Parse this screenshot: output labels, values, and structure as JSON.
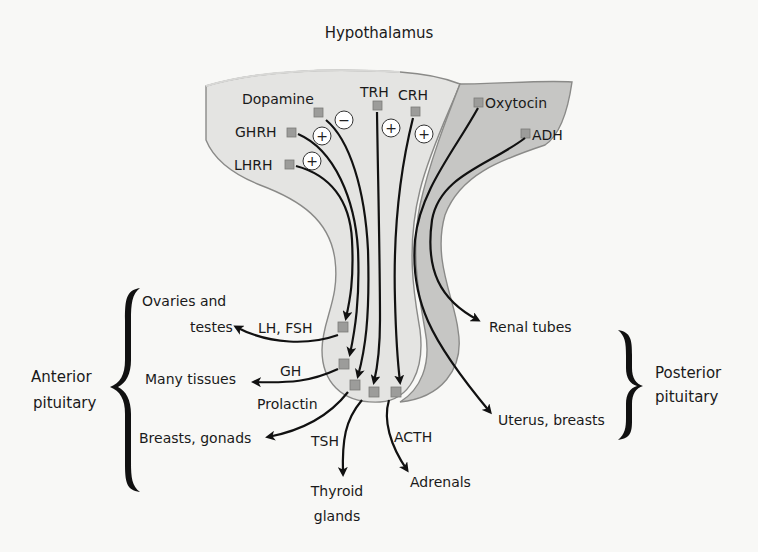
{
  "title": "Hypothalamus",
  "colors": {
    "background": "#f8f8f6",
    "anterior_fill": "#e4e4e2",
    "posterior_fill": "#c6c6c4",
    "outline": "#8a8a88",
    "marker": "#9c9c9a",
    "arrow": "#111111"
  },
  "hypothalamus_hormones": [
    {
      "label": "Dopamine",
      "effect": "−"
    },
    {
      "label": "GHRH",
      "effect": "+"
    },
    {
      "label": "LHRH",
      "effect": "+"
    },
    {
      "label": "TRH",
      "effect": "+"
    },
    {
      "label": "CRH",
      "effect": "+"
    },
    {
      "label": "Oxytocin"
    },
    {
      "label": "ADH"
    }
  ],
  "anterior": {
    "group_label_line1": "Anterior",
    "group_label_line2": "pituitary",
    "outputs": [
      {
        "hormone": "LH, FSH",
        "target_line1": "Ovaries and",
        "target_line2": "testes"
      },
      {
        "hormone": "GH",
        "target": "Many tissues"
      },
      {
        "hormone": "Prolactin",
        "target": "Breasts, gonads"
      },
      {
        "hormone": "TSH",
        "target_line1": "Thyroid",
        "target_line2": "glands"
      },
      {
        "hormone": "ACTH",
        "target": "Adrenals"
      }
    ]
  },
  "posterior": {
    "group_label_line1": "Posterior",
    "group_label_line2": "pituitary",
    "outputs": [
      {
        "target": "Renal tubes"
      },
      {
        "target": "Uterus, breasts"
      }
    ]
  }
}
